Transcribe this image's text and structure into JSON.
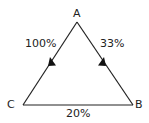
{
  "diagram": {
    "vertices": [
      {
        "id": "A",
        "label": "A"
      },
      {
        "id": "B",
        "label": "B"
      },
      {
        "id": "C",
        "label": "C"
      }
    ],
    "edges": [
      {
        "from": "A",
        "to": "C",
        "label": "100%",
        "directed": true
      },
      {
        "from": "A",
        "to": "B",
        "label": "33%",
        "directed": true
      },
      {
        "from": "C",
        "to": "B",
        "label": "20%",
        "directed": false
      }
    ],
    "line_color": "#222222"
  }
}
